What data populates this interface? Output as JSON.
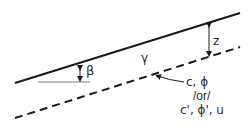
{
  "diagram": {
    "labels": {
      "beta": "β",
      "gamma": "γ",
      "z": "z",
      "strength_line1": "c, ϕ",
      "strength_line2": "/or/",
      "strength_line3": "c', ϕ', u"
    },
    "elements": {
      "ground_surface": "solid line",
      "failure_plane": "dashed line",
      "slope_angle": "β",
      "unit_weight": "γ",
      "depth": "z"
    },
    "colors": {
      "line": "#1a1a1a",
      "thin_line": "#555555",
      "background": "#ffffff"
    }
  }
}
